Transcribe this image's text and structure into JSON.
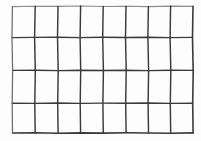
{
  "image": {
    "kind": "scanned-hand-drawn-grid",
    "width": 201,
    "height": 141,
    "background_color": "#fdfdfd",
    "ink_color": "#3a3a3a",
    "faint_ink_color": "#8d8d8d"
  },
  "grid": {
    "columns": 8,
    "rows": 4,
    "cells": 32,
    "vertical_line_count": 9,
    "horizontal_line_count": 5,
    "bounds": {
      "left": 12,
      "top": 6,
      "right": 193,
      "bottom": 133
    },
    "vertical_line_x": [
      12,
      35,
      58,
      80,
      103,
      126,
      148,
      170,
      193
    ],
    "horizontal_line_y": [
      6,
      37,
      70,
      103,
      133
    ],
    "column_widths": [
      23,
      23,
      22,
      23,
      23,
      22,
      22,
      23
    ],
    "row_heights": [
      31,
      33,
      33,
      30
    ],
    "style": "hand-drawn wobbly ink strokes, uneven pressure, faint upper-left edges"
  },
  "vertical_paths": [
    "M 12.4 6.6 L 12.0 37.6 L 12.6 70.4 L 12.2 103.2 L 12.5 133.0",
    "M 35.2 6.2 L 34.6 37.4 L 35.3 70.2 L 34.8 103.4 L 35.2 132.8",
    "M 58.0 6.4 L 57.5 37.2 L 58.2 70.6 L 57.7 103.0 L 58.1 133.2",
    "M 80.6 6.0 L 80.1 37.6 L 80.7 70.2 L 80.2 103.4 L 80.6 132.9",
    "M 103.2 6.5 L 102.7 37.3 L 103.4 70.5 L 102.9 103.1 L 103.3 133.1",
    "M 126.0 6.2 L 125.5 37.5 L 126.2 70.3 L 125.7 103.3 L 126.1 132.8",
    "M 148.4 6.6 L 147.9 37.2 L 148.6 70.6 L 148.1 103.0 L 148.5 133.0",
    "M 170.6 6.1 L 170.1 37.6 L 170.8 70.2 L 170.3 103.4 L 170.7 133.2",
    "M 193.0 6.4 L 192.5 37.4 L 193.2 70.4 L 192.7 103.2 L 193.1 132.9"
  ],
  "horizontal_paths": [
    "M 12.4 6.6 L 35.2 6.2 L 58.0 6.4 L 80.6 6.0 L 103.2 6.5 L 126.0 6.2 L 148.4 6.6 L 170.6 6.1 L 193.0 6.4",
    "M 12.0 37.6 L 34.6 37.4 L 57.5 37.2 L 80.1 37.6 L 102.7 37.3 L 125.5 37.5 L 147.9 37.2 L 170.1 37.6 L 192.5 37.4",
    "M 12.6 70.4 L 35.3 70.2 L 58.2 70.6 L 80.7 70.2 L 103.4 70.5 L 126.2 70.3 L 148.6 70.6 L 170.8 70.2 L 193.2 70.4",
    "M 12.2 103.2 L 34.8 103.4 L 57.7 103.0 L 80.2 103.4 L 102.9 103.1 L 125.7 103.3 L 148.1 103.0 L 170.3 103.4 L 192.7 103.2",
    "M 12.5 133.0 L 35.2 132.8 L 58.1 133.2 L 80.6 132.9 L 103.3 133.1 L 126.1 132.8 L 148.5 133.0 L 170.7 133.2 L 193.1 132.9"
  ]
}
